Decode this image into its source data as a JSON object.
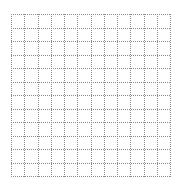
{
  "grid": {
    "rows": 12,
    "cols": 12,
    "line_color": "#8a8a8a",
    "background": "#ffffff",
    "line_style": "dotted"
  }
}
